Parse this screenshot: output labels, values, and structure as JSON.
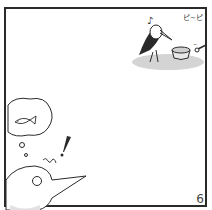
{
  "panel": {
    "page_number": "6",
    "sound_effect_top": "ピ~ピ",
    "music_note": "♪",
    "exclamation": "!",
    "thought_bubble_content": "fish",
    "colors": {
      "ink": "#2a2a2a",
      "shadow": "#cfcfcf",
      "tone": "#e2e2e2",
      "background": "#ffffff"
    }
  }
}
